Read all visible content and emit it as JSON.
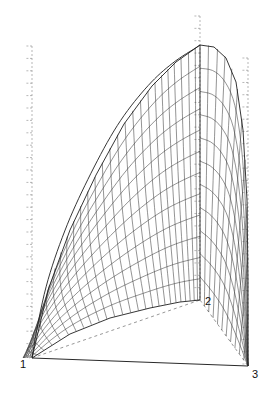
{
  "figure": {
    "type": "3d-surface-mesh",
    "background_color": "#ffffff",
    "line_color": "#3a3a3a",
    "axis_color": "#9a9a9a",
    "width": 266,
    "height": 393
  },
  "vertices": [
    {
      "name": "vertex-1",
      "label": "1",
      "x": 32,
      "y": 358,
      "label_x": 20,
      "label_y": 368
    },
    {
      "name": "vertex-2",
      "label": "2",
      "x": 200,
      "y": 300,
      "label_x": 205,
      "label_y": 305
    },
    {
      "name": "vertex-3",
      "label": "3",
      "x": 248,
      "y": 366,
      "label_x": 252,
      "label_y": 378
    }
  ],
  "axes": [
    {
      "name": "left-axis",
      "orientation": "vertical",
      "x": 32,
      "y_top": 46,
      "y_bottom": 356,
      "tick_count": 25,
      "tick_length": 7,
      "tick_side": "left",
      "style": "dashed"
    },
    {
      "name": "center-axis",
      "orientation": "vertical",
      "x": 200,
      "y_top": 16,
      "y_bottom": 300,
      "tick_count": 23,
      "tick_length": 7,
      "tick_side": "left",
      "style": "dashed"
    },
    {
      "name": "right-axis",
      "orientation": "vertical",
      "x": 248,
      "y_top": 58,
      "y_bottom": 364,
      "tick_count": 25,
      "tick_length": 7,
      "tick_side": "left",
      "style": "dashed"
    }
  ],
  "base_edges": [
    {
      "name": "base-edge-1-3",
      "from": "vertex-1",
      "to": "vertex-3",
      "style": "solid"
    },
    {
      "name": "base-edge-1-2",
      "from": "vertex-1",
      "to": "vertex-2",
      "style": "dashed"
    },
    {
      "name": "base-edge-2-3",
      "from": "vertex-2",
      "to": "vertex-3",
      "style": "dashed"
    }
  ],
  "mesh": {
    "u_lines": 25,
    "v_lines": 11,
    "description": "near-vertical generator lines fanning from vertex 1 crossed by curved horizontal contour lines"
  },
  "chart_data": {
    "type": "line",
    "title": "",
    "xlabel": "",
    "ylabel": "",
    "grid": true,
    "legend": null,
    "vertex_labels": [
      "1",
      "2",
      "3"
    ],
    "apex": {
      "x": 200,
      "y": 45
    },
    "ridge_line": {
      "from_x": 200,
      "from_y": 45,
      "to_x": 200,
      "to_y": 300
    },
    "surface_profile_left": [
      {
        "x": 32,
        "y": 358
      },
      {
        "x": 48,
        "y": 290
      },
      {
        "x": 70,
        "y": 230
      },
      {
        "x": 96,
        "y": 175
      },
      {
        "x": 124,
        "y": 124
      },
      {
        "x": 152,
        "y": 86
      },
      {
        "x": 176,
        "y": 62
      },
      {
        "x": 200,
        "y": 45
      }
    ],
    "surface_profile_right": [
      {
        "x": 200,
        "y": 45
      },
      {
        "x": 214,
        "y": 47
      },
      {
        "x": 226,
        "y": 58
      },
      {
        "x": 236,
        "y": 82
      },
      {
        "x": 243,
        "y": 130
      },
      {
        "x": 247,
        "y": 200
      },
      {
        "x": 248,
        "y": 280
      },
      {
        "x": 248,
        "y": 366
      }
    ],
    "base_curve": [
      {
        "x": 32,
        "y": 358
      },
      {
        "x": 70,
        "y": 334
      },
      {
        "x": 110,
        "y": 318
      },
      {
        "x": 150,
        "y": 308
      },
      {
        "x": 180,
        "y": 302
      },
      {
        "x": 200,
        "y": 300
      }
    ]
  }
}
